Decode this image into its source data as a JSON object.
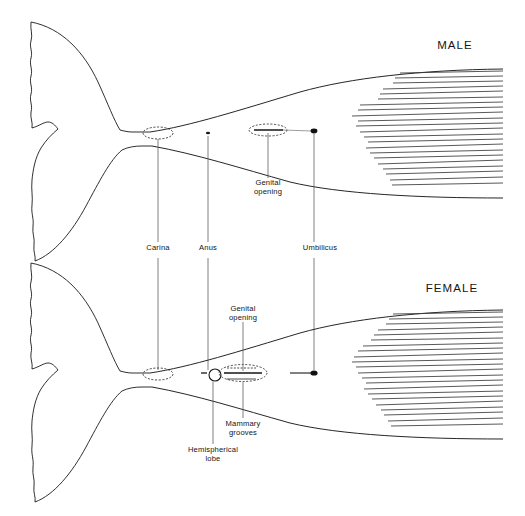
{
  "figure": {
    "background_color": "#ffffff",
    "ink_color": "#1a1a1a",
    "width": 525,
    "height": 516
  },
  "panels": [
    {
      "id": "male",
      "heading": "MALE",
      "heading_pos": {
        "x": 455,
        "y": 48
      },
      "body_axis_y": 135,
      "features": [
        {
          "name": "carina",
          "marker": "dashed-oval",
          "x": 158,
          "y": 133,
          "rx": 15,
          "ry": 6
        },
        {
          "name": "anus",
          "marker": "small-dot",
          "x": 208,
          "y": 133,
          "rx": 2,
          "ry": 1.2
        },
        {
          "name": "genital-opening",
          "marker": "slit-in-oval",
          "x": 268,
          "y": 130,
          "rx": 19,
          "ry": 6
        },
        {
          "name": "umbilicus",
          "marker": "filled-dot",
          "x": 314,
          "y": 131,
          "rx": 3.2,
          "ry": 2.4
        }
      ],
      "hatch": {
        "count": 22,
        "x_right": 503,
        "y_top": 72,
        "y_bottom": 188
      }
    },
    {
      "id": "female",
      "heading": "FEMALE",
      "heading_pos": {
        "x": 452,
        "y": 291
      },
      "body_axis_y": 375,
      "features": [
        {
          "name": "carina",
          "marker": "dashed-oval",
          "x": 158,
          "y": 374,
          "rx": 15,
          "ry": 6
        },
        {
          "name": "anus",
          "marker": "small-dash",
          "x": 204,
          "y": 373,
          "rx": 3,
          "ry": 1
        },
        {
          "name": "hemispherical-lobe",
          "marker": "open-circle",
          "x": 215,
          "y": 375,
          "r": 6
        },
        {
          "name": "genital-opening",
          "marker": "slit-in-oval",
          "x": 242,
          "y": 373,
          "rx": 24,
          "ry": 8
        },
        {
          "name": "mammary-grooves",
          "marker": "paired-lines",
          "x": 242,
          "y": 379
        },
        {
          "name": "umbilicus",
          "marker": "filled-dot",
          "x": 314,
          "y": 373,
          "rx": 3.4,
          "ry": 2.6
        }
      ],
      "hatch": {
        "count": 22,
        "x_right": 503,
        "y_top": 312,
        "y_bottom": 430
      }
    }
  ],
  "labels": [
    {
      "id": "male-heading",
      "text": "MALE",
      "x": 455,
      "y": 48,
      "size": "big"
    },
    {
      "id": "female-heading",
      "text": "FEMALE",
      "x": 452,
      "y": 291,
      "size": "big"
    },
    {
      "id": "male-genital-opening",
      "text": "Genital\nopening",
      "x": 268,
      "y": 183,
      "size": "small"
    },
    {
      "id": "carina",
      "text": "Carina",
      "x": 158,
      "y": 249,
      "size": "small"
    },
    {
      "id": "anus",
      "text": "Anus",
      "x": 208,
      "y": 249,
      "size": "small"
    },
    {
      "id": "umbilicus",
      "text": "Umbilicus",
      "x": 320,
      "y": 249,
      "size": "small"
    },
    {
      "id": "female-genital-opening",
      "text": "Genital\nopening",
      "x": 243,
      "y": 310,
      "size": "small"
    },
    {
      "id": "mammary-grooves",
      "text": "Mammary\ngrooves",
      "x": 243,
      "y": 424,
      "size": "small"
    },
    {
      "id": "hemispherical-lobe",
      "text": "Hemispherical\nlobe",
      "x": 213,
      "y": 450,
      "size": "small"
    }
  ],
  "leader_lines": [
    {
      "id": "leader-carina-male",
      "x": 158,
      "y1": 136,
      "y2": 242
    },
    {
      "id": "leader-anus-male",
      "x": 208,
      "y1": 136,
      "y2": 242
    },
    {
      "id": "leader-umbilicus-male",
      "x": 314,
      "y1": 136,
      "y2": 242
    },
    {
      "id": "leader-carina-female",
      "x": 158,
      "y1": 258,
      "y2": 371
    },
    {
      "id": "leader-anus-female",
      "x": 208,
      "y1": 258,
      "y2": 371
    },
    {
      "id": "leader-umbilicus-female",
      "x": 314,
      "y1": 258,
      "y2": 371
    },
    {
      "id": "leader-genital-male",
      "x": 268,
      "y1": 133,
      "y2": 178
    },
    {
      "id": "leader-genital-female",
      "x": 243,
      "y1": 322,
      "y2": 372
    },
    {
      "id": "leader-mammary-female",
      "x": 243,
      "y1": 384,
      "y2": 418
    },
    {
      "id": "leader-lobe-female",
      "x": 213,
      "y1": 382,
      "y2": 444
    }
  ]
}
